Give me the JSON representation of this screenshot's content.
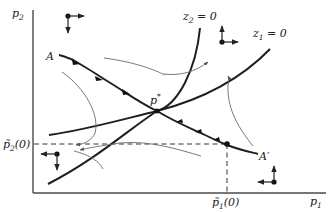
{
  "figure": {
    "axes": {
      "x_label": "p",
      "x_label_sub": "1",
      "y_label": "p",
      "y_label_sub": "2"
    },
    "curves": {
      "z1": {
        "label_var": "z",
        "label_sub": "1",
        "label_rest": " = 0"
      },
      "z2": {
        "label_var": "z",
        "label_sub": "2",
        "label_rest": " = 0"
      },
      "saddle_path": {
        "start_label": "A",
        "end_label": "A′"
      }
    },
    "equilibrium": {
      "label": "p",
      "label_sup": "*"
    },
    "initial": {
      "p1_tick": {
        "var": "p̃",
        "sub": "1",
        "rest": "(0)"
      },
      "p2_tick": {
        "var": "p̃",
        "sub": "2",
        "rest": "(0)"
      }
    },
    "direction_markers": [
      {
        "region": "top-left",
        "horizontal": "right",
        "vertical": "down"
      },
      {
        "region": "top-right",
        "horizontal": "right",
        "vertical": "up"
      },
      {
        "region": "bottom-left",
        "horizontal": "left",
        "vertical": "down"
      },
      {
        "region": "bottom-right",
        "horizontal": "left",
        "vertical": "up"
      }
    ],
    "colors": {
      "ink": "#1e1e1e",
      "thin_trajectory": "#6a6a6a",
      "background": "#ffffff"
    }
  }
}
